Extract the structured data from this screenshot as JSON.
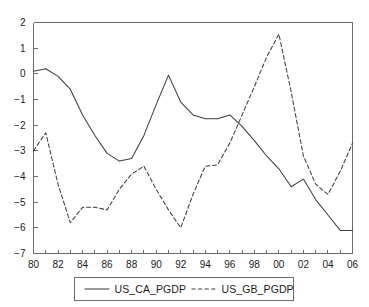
{
  "chart_data": {
    "type": "line",
    "title": "",
    "xlabel": "",
    "ylabel": "",
    "xlim": [
      1980,
      2006
    ],
    "ylim": [
      -7,
      2
    ],
    "grid": false,
    "legend_position": "bottom-center",
    "x": [
      1980,
      1981,
      1982,
      1983,
      1984,
      1985,
      1986,
      1987,
      1988,
      1989,
      1990,
      1991,
      1992,
      1993,
      1994,
      1995,
      1996,
      1997,
      1998,
      1999,
      2000,
      2001,
      2002,
      2003,
      2004,
      2005,
      2006
    ],
    "x_tick_labels": [
      "80",
      "82",
      "84",
      "86",
      "88",
      "90",
      "92",
      "94",
      "96",
      "98",
      "00",
      "02",
      "04",
      "06"
    ],
    "x_tick_values": [
      1980,
      1982,
      1984,
      1986,
      1988,
      1990,
      1992,
      1994,
      1996,
      1998,
      2000,
      2002,
      2004,
      2006
    ],
    "y_tick_labels": [
      "2",
      "1",
      "0",
      "-1",
      "-2",
      "-3",
      "-4",
      "-5",
      "-6",
      "-7"
    ],
    "y_tick_values": [
      2,
      1,
      0,
      -1,
      -2,
      -3,
      -4,
      -5,
      -6,
      -7
    ],
    "series": [
      {
        "name": "US_CA_PGDP",
        "style": "solid",
        "color": "#3d3d3d",
        "values": [
          0.1,
          0.2,
          -0.1,
          -0.6,
          -1.6,
          -2.4,
          -3.1,
          -3.4,
          -3.3,
          -2.4,
          -1.2,
          -0.05,
          -1.1,
          -1.6,
          -1.75,
          -1.75,
          -1.6,
          -2.05,
          -2.6,
          -3.2,
          -3.7,
          -4.4,
          -4.1,
          -4.9,
          -5.5,
          -6.1,
          -6.1
        ]
      },
      {
        "name": "US_GB_PGDP",
        "style": "dashed",
        "color": "#3d3d3d",
        "values": [
          -3.0,
          -2.3,
          -4.3,
          -5.8,
          -5.2,
          -5.2,
          -5.3,
          -4.5,
          -3.9,
          -3.6,
          -4.5,
          -5.3,
          -6.0,
          -4.7,
          -3.6,
          -3.55,
          -2.7,
          -1.6,
          -0.5,
          0.65,
          1.55,
          -0.7,
          -3.2,
          -4.3,
          -4.7,
          -3.8,
          -2.7
        ]
      }
    ]
  },
  "legend": {
    "entries": [
      {
        "label": "US_CA_PGDP",
        "style": "solid"
      },
      {
        "label": "US_GB_PGDP",
        "style": "dashed"
      }
    ]
  }
}
